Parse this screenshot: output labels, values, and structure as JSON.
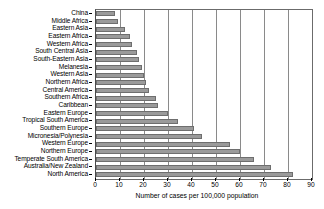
{
  "chart_data": {
    "type": "bar",
    "orientation": "horizontal",
    "title": "",
    "xlabel": "Number of cases per 100,000 population",
    "ylabel": "",
    "xlim": [
      0,
      90
    ],
    "xticks": [
      0,
      10,
      20,
      30,
      40,
      50,
      60,
      70,
      80,
      90
    ],
    "grid": true,
    "grid_axis": "x",
    "legend": null,
    "bar_color": "#9a9a9a",
    "bar_edge_color": "#6e6e6e",
    "categories": [
      "China",
      "Middle Africa",
      "Eastern Asia",
      "Eastern Africa",
      "Western Africa",
      "South Central Asia",
      "South-Eastern Asia",
      "Melanesia",
      "Western Asia",
      "Northern Africa",
      "Central America",
      "Southern Africa",
      "Caribbean",
      "Eastern Europe",
      "Tropical South America",
      "Southern Europe",
      "Micronesia/Polynesia",
      "Western Europe",
      "Northern Europe",
      "Temperate South America",
      "Australia/New Zealand",
      "North America"
    ],
    "values": [
      8,
      9,
      12,
      14,
      15,
      17,
      18,
      19,
      20,
      21,
      22,
      25,
      26,
      30,
      34,
      41,
      44,
      56,
      60,
      66,
      73,
      82
    ]
  }
}
